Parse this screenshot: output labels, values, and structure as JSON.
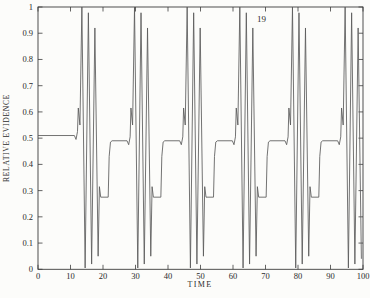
{
  "figure": {
    "kind": "scientific line plot, box frame with inward ticks on all four sides, no grid, no legend"
  },
  "chart_data": {
    "type": "line",
    "title": "",
    "xlabel": "TIME",
    "ylabel": "RELATIVE EVIDENCE",
    "xlim": [
      0,
      100
    ],
    "ylim": [
      0,
      1
    ],
    "grid": false,
    "frame": "box",
    "tick_direction": "inward, mirrored on top and right axes",
    "line_color": "#5a5a5a",
    "text_color": "#2b2b2b",
    "background_color": "#fcfcfa",
    "xticks": {
      "values": [
        0,
        10,
        20,
        30,
        40,
        50,
        60,
        70,
        80,
        90,
        100
      ],
      "labels": [
        "0",
        "10",
        "20",
        "30",
        "40",
        "50",
        "60",
        "70",
        "80",
        "90",
        "100"
      ]
    },
    "yticks": {
      "values": [
        0,
        0.1,
        0.2,
        0.3,
        0.4,
        0.5,
        0.6,
        0.7,
        0.8,
        0.9,
        1
      ],
      "labels": [
        "0",
        "0.1",
        "0.2",
        "0.3",
        "0.4",
        "0.5",
        "0.6",
        "0.7",
        "0.8",
        "0.9",
        "1"
      ]
    },
    "annotations": [
      {
        "text": "19",
        "x": 68.8,
        "y": 0.955
      }
    ],
    "pattern_note": "periodic waveform, period ~16.2 time units: plateau at ~0.5, small dip then sharp sub-peak to ~0.62, three large oscillation spikes to ~1.0/0.98/0.92 with troughs near 0, then low plateau at ~0.27, steep rise back to ~0.5",
    "series": [
      {
        "name": "relative evidence",
        "points": [
          [
            0,
            0.51
          ],
          [
            11.2,
            0.51
          ],
          [
            11.7,
            0.495
          ],
          [
            12.15,
            0.525
          ],
          [
            12.4,
            0.615
          ],
          [
            12.9,
            0.55
          ],
          [
            13.5,
            1.0
          ],
          [
            14.5,
            0.005
          ],
          [
            15.5,
            0.978
          ],
          [
            16.5,
            0.02
          ],
          [
            17.5,
            0.92
          ],
          [
            18.5,
            0.05
          ],
          [
            18.9,
            0.315
          ],
          [
            19.3,
            0.275
          ],
          [
            21.6,
            0.275
          ],
          [
            21.9,
            0.43
          ],
          [
            22.3,
            0.485
          ],
          [
            22.8,
            0.49
          ],
          [
            27.4,
            0.49
          ],
          [
            27.9,
            0.475
          ],
          [
            28.35,
            0.505
          ],
          [
            28.6,
            0.615
          ],
          [
            29.1,
            0.55
          ],
          [
            29.7,
            1.0
          ],
          [
            30.7,
            0.005
          ],
          [
            31.7,
            0.978
          ],
          [
            32.7,
            0.02
          ],
          [
            33.7,
            0.92
          ],
          [
            34.7,
            0.05
          ],
          [
            35.1,
            0.315
          ],
          [
            35.5,
            0.275
          ],
          [
            37.8,
            0.275
          ],
          [
            38.1,
            0.43
          ],
          [
            38.5,
            0.485
          ],
          [
            39.0,
            0.49
          ],
          [
            43.6,
            0.49
          ],
          [
            44.1,
            0.475
          ],
          [
            44.55,
            0.505
          ],
          [
            44.8,
            0.615
          ],
          [
            45.3,
            0.55
          ],
          [
            45.9,
            1.0
          ],
          [
            46.9,
            0.005
          ],
          [
            47.9,
            0.978
          ],
          [
            48.9,
            0.02
          ],
          [
            49.9,
            0.92
          ],
          [
            50.9,
            0.05
          ],
          [
            51.3,
            0.315
          ],
          [
            51.7,
            0.275
          ],
          [
            54.0,
            0.275
          ],
          [
            54.3,
            0.43
          ],
          [
            54.7,
            0.485
          ],
          [
            55.2,
            0.49
          ],
          [
            59.8,
            0.49
          ],
          [
            60.3,
            0.475
          ],
          [
            60.75,
            0.505
          ],
          [
            61.0,
            0.615
          ],
          [
            61.5,
            0.55
          ],
          [
            62.1,
            1.0
          ],
          [
            63.1,
            0.005
          ],
          [
            64.1,
            0.978
          ],
          [
            65.1,
            0.02
          ],
          [
            66.1,
            0.92
          ],
          [
            67.1,
            0.05
          ],
          [
            67.5,
            0.315
          ],
          [
            67.9,
            0.275
          ],
          [
            70.2,
            0.275
          ],
          [
            70.5,
            0.43
          ],
          [
            70.9,
            0.485
          ],
          [
            71.4,
            0.49
          ],
          [
            76.0,
            0.49
          ],
          [
            76.5,
            0.475
          ],
          [
            76.95,
            0.505
          ],
          [
            77.2,
            0.615
          ],
          [
            77.7,
            0.55
          ],
          [
            78.3,
            1.0
          ],
          [
            79.3,
            0.005
          ],
          [
            80.3,
            0.978
          ],
          [
            81.3,
            0.02
          ],
          [
            82.3,
            0.92
          ],
          [
            83.3,
            0.05
          ],
          [
            83.7,
            0.315
          ],
          [
            84.1,
            0.275
          ],
          [
            86.4,
            0.275
          ],
          [
            86.7,
            0.43
          ],
          [
            87.1,
            0.485
          ],
          [
            87.6,
            0.49
          ],
          [
            92.2,
            0.49
          ],
          [
            92.7,
            0.475
          ],
          [
            93.15,
            0.505
          ],
          [
            93.4,
            0.615
          ],
          [
            93.9,
            0.55
          ],
          [
            94.5,
            1.0
          ],
          [
            95.5,
            0.005
          ],
          [
            96.5,
            0.978
          ],
          [
            97.5,
            0.02
          ],
          [
            98.5,
            0.92
          ],
          [
            99.5,
            0.04
          ]
        ]
      }
    ]
  }
}
